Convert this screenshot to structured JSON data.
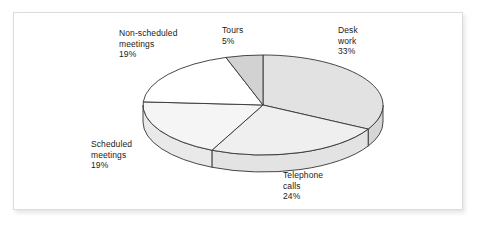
{
  "figure": {
    "background_color": "#ffffff",
    "frame_border_color": "#dcdcdc"
  },
  "chart_data": {
    "type": "pie",
    "title": "",
    "subtitle": "",
    "xlabel": "",
    "ylabel": "",
    "legend_position": "none",
    "grid": false,
    "style": "3d-exploded-none",
    "categories": [
      "Desk work",
      "Telephone calls",
      "Scheduled meetings",
      "Non-scheduled meetings",
      "Tours"
    ],
    "values": [
      33,
      24,
      19,
      19,
      5
    ],
    "unit": "%",
    "labels": [
      {
        "name": "Desk work",
        "line1": "Desk",
        "line2": "work",
        "value": "33%",
        "value_number": 33,
        "fill": "#e2e2e2"
      },
      {
        "name": "Telephone calls",
        "line1": "Telephone",
        "line2": "calls",
        "value": "24%",
        "value_number": 24,
        "fill": "#efefef"
      },
      {
        "name": "Scheduled meetings",
        "line1": "Scheduled",
        "line2": "meetings",
        "value": "19%",
        "value_number": 19,
        "fill": "#f5f5f5"
      },
      {
        "name": "Non-scheduled meetings",
        "line1": "Non-scheduled",
        "line2": "meetings",
        "value": "19%",
        "value_number": 19,
        "fill": "#ffffff"
      },
      {
        "name": "Tours",
        "line1": "Tours",
        "line2": "",
        "value": "5%",
        "value_number": 5,
        "fill": "#d2d2d2"
      }
    ],
    "colors": {
      "outline": "#333333",
      "desk_work": "#e2e2e2",
      "telephone_calls": "#efefef",
      "scheduled_meetings": "#f5f5f5",
      "non_scheduled_meetings": "#ffffff",
      "tours": "#d2d2d2"
    }
  }
}
